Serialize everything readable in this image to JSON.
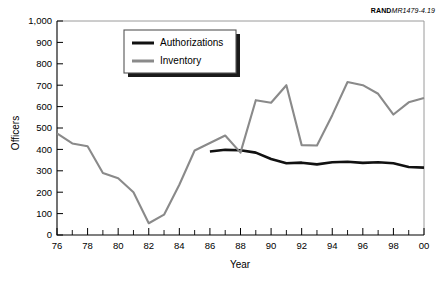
{
  "figure": {
    "source_note_prefix": "RAND",
    "source_note_id": "MR1479-4.19"
  },
  "chart_data": {
    "type": "line",
    "title": "",
    "xlabel": "Year",
    "ylabel": "Officers",
    "xlim": [
      1976,
      2000
    ],
    "ylim": [
      0,
      1000
    ],
    "ytick_step": 100,
    "xtick_step": 1,
    "xtick_label_step": 2,
    "grid": false,
    "legend_position": "upper-left-inside",
    "ytick_labels": [
      "0",
      "100",
      "200",
      "300",
      "400",
      "500",
      "600",
      "700",
      "800",
      "900",
      "1,000"
    ],
    "ytick_values": [
      0,
      100,
      200,
      300,
      400,
      500,
      600,
      700,
      800,
      900,
      1000
    ],
    "xtick_labels": [
      "76",
      "78",
      "80",
      "82",
      "84",
      "86",
      "88",
      "90",
      "92",
      "94",
      "96",
      "98",
      "00"
    ],
    "xtick_values": [
      1976,
      1978,
      1980,
      1982,
      1984,
      1986,
      1988,
      1990,
      1992,
      1994,
      1996,
      1998,
      2000
    ],
    "x": [
      1976,
      1977,
      1978,
      1979,
      1980,
      1981,
      1982,
      1983,
      1984,
      1985,
      1986,
      1987,
      1988,
      1989,
      1990,
      1991,
      1992,
      1993,
      1994,
      1995,
      1996,
      1997,
      1998,
      1999,
      2000
    ],
    "series": [
      {
        "name": "Authorizations",
        "color": "#111111",
        "x": [
          1986,
          1987,
          1988,
          1989,
          1990,
          1991,
          1992,
          1993,
          1994,
          1995,
          1996,
          1997,
          1998,
          1999,
          2000
        ],
        "values": [
          390,
          398,
          396,
          385,
          355,
          335,
          338,
          330,
          340,
          342,
          337,
          340,
          335,
          318,
          315
        ]
      },
      {
        "name": "Inventory",
        "color": "#8a8a8a",
        "x": [
          1976,
          1977,
          1978,
          1979,
          1980,
          1981,
          1982,
          1983,
          1984,
          1985,
          1986,
          1987,
          1988,
          1989,
          1990,
          1991,
          1992,
          1993,
          1994,
          1995,
          1996,
          1997,
          1998,
          1999,
          2000
        ],
        "values": [
          475,
          428,
          415,
          290,
          265,
          200,
          55,
          95,
          235,
          395,
          430,
          465,
          385,
          630,
          618,
          700,
          420,
          418,
          560,
          715,
          700,
          660,
          563,
          620,
          640
        ]
      }
    ]
  },
  "legend": {
    "items": [
      {
        "label": "Authorizations",
        "color": "#111111"
      },
      {
        "label": "Inventory",
        "color": "#8a8a8a"
      }
    ]
  }
}
